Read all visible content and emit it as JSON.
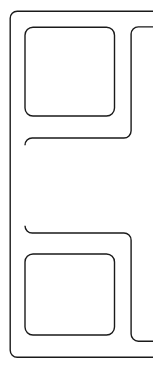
{
  "drawing": {
    "title": "Extruded Profile Cross-Section",
    "type": "technical-line-drawing",
    "subject": "bracket-profile-outline",
    "canvas": {
      "width": 153,
      "height": 368,
      "background_color": "#ffffff"
    },
    "line_style": {
      "stroke_color": "#1a1a1a",
      "stroke_width": 1.4,
      "fill": "none",
      "corner_style": "rounded"
    },
    "geometry": {
      "wall_thickness": 15,
      "corner_radius_outer": 7,
      "corner_radius_inner": 8,
      "outer_contour": {
        "name": "outer-boundary",
        "left_x": 10,
        "top_y": 11,
        "bottom_y": 357,
        "right_edge": "cropped-at-canvas-edge",
        "description": "C-shaped outer wall open to the right, rounded left corners"
      },
      "cutouts": [
        {
          "name": "top-square-cutout",
          "x": 25,
          "y": 27,
          "width": 89,
          "height": 89,
          "corner_radius": 8
        },
        {
          "name": "bottom-square-cutout",
          "x": 25,
          "y": 254,
          "width": 89,
          "height": 81,
          "corner_radius": 8
        }
      ],
      "middle_notch": {
        "name": "center-notch",
        "left_x": 25,
        "top_y": 138,
        "bottom_y": 233,
        "right_x": 131,
        "description": "open rectangular slot extending to the right flange"
      },
      "right_flange": {
        "name": "right-flange-line",
        "x": 131,
        "top_y": 27,
        "bottom_y": 341,
        "description": "vertical inner wall of right flange, horizontal returns cropped at right edge"
      }
    },
    "paths": {
      "outer": "M 153 11.2 L 17.2 11.2 A 7 7 0 0 0 10.2 18.2 L 10.2 350.2 A 7 7 0 0 0 17.2 357.2 L 153 357.2",
      "inner": "M 153 26.8 L 128.5 26.8 A 3.2 3.2 0 0 0 125.3 30 L 125.3 110.5 A 7.5 7.5 0 0 1 117.8 118 L 32.5 118 A 7.5 7.5 0 0 0 25 125.5 L 25 246 A 7.5 7.5 0 0 0 32.5 253.5 L 117.8 253.5 A 7.5 7.5 0 0 1 125.3 261 L 125.3 338 A 3.2 3.2 0 0 0 128.5 341.2 L 153 341.2",
      "cutout_top": "M 33 27.2 L 106.5 27.2 A 8 8 0 0 1 114.5 35.2 L 114.5 108 A 8 8 0 0 1 106.5 116 L 33 116 A 8 8 0 0 1 25 108 L 25 35.2 A 8 8 0 0 1 33 27.2 Z",
      "cutout_bottom": "M 33 254 L 106.5 254 A 8 8 0 0 1 114.5 262 L 114.5 327 A 8 8 0 0 1 106.5 335 L 33 335 A 8 8 0 0 1 25 327 L 25 262 A 8 8 0 0 1 33 254 Z",
      "notch_upper": "M 153 26.9 L 138.3 26.9 A 7.2 7.2 0 0 0 131.1 34.1 L 131.1 130.8 A 7.2 7.2 0 0 1 123.9 138 L 32.2 138 A 7.2 7.2 0 0 0 25 145.2",
      "notch_lower": "M 25 225.8 A 7.2 7.2 0 0 0 32.2 233 L 123.9 233 A 7.2 7.2 0 0 1 131.1 240.2 L 131.1 334 A 7.2 7.2 0 0 0 138.3 341.2 L 153 341.2"
    }
  }
}
